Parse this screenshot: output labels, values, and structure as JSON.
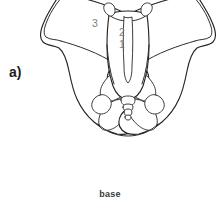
{
  "figure": {
    "panel_label": "a)",
    "caption": "base",
    "background_color": "#ffffff",
    "line_color": "#242424",
    "label_color": "#1c1c1c",
    "callout_color": "#7d7d7d",
    "callouts": [
      {
        "id": "callout-1",
        "label": "1",
        "x": 84,
        "y": 47
      },
      {
        "id": "callout-2",
        "label": "2",
        "x": 84,
        "y": 35
      },
      {
        "id": "callout-3",
        "label": "3",
        "x": 57,
        "y": 26
      }
    ]
  }
}
